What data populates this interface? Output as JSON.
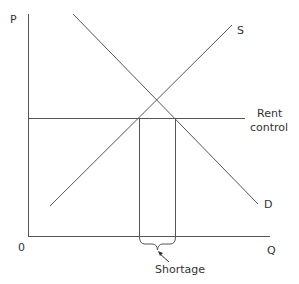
{
  "diagram": {
    "axis_labels": {
      "y": "P",
      "x": "Q",
      "origin": "0"
    },
    "curves": {
      "supply": "S",
      "demand": "D"
    },
    "price_ceiling": {
      "line1": "Rent",
      "line2": "control"
    },
    "gap_label": "Shortage",
    "colors": {
      "line": "#555555",
      "text": "#333333",
      "background": "#ffffff"
    }
  }
}
